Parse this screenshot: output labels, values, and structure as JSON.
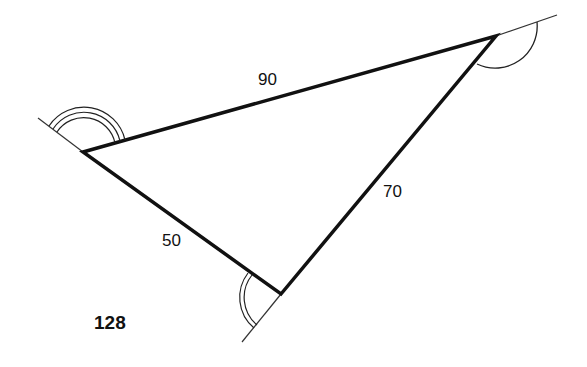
{
  "figure": {
    "number": "128",
    "sides": {
      "top": "90",
      "right": "70",
      "left": "50"
    },
    "vertices": {
      "left": [
        83,
        152
      ],
      "right": [
        496,
        36
      ],
      "bottom": [
        281,
        294
      ]
    },
    "exterior_angle_marks": {
      "left": "triple-arc",
      "right": "single-arc",
      "bottom": "double-arc"
    },
    "colors": {
      "stroke": "#111111",
      "background": "#ffffff"
    }
  }
}
